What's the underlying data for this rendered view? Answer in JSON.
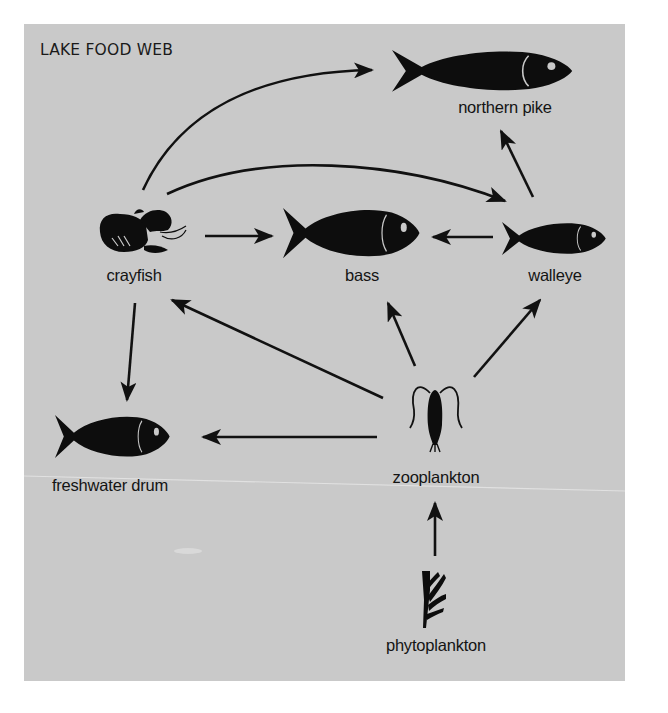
{
  "title": "LAKE FOOD WEB",
  "colors": {
    "background": "#c9c9c9",
    "ink": "#111111",
    "page": "#ffffff"
  },
  "nodes": [
    {
      "id": "northern-pike",
      "label": "northern pike",
      "icon": "fish-icon",
      "label_x": 505,
      "label_y": 98
    },
    {
      "id": "crayfish",
      "label": "crayfish",
      "icon": "crayfish-icon",
      "label_x": 134,
      "label_y": 266
    },
    {
      "id": "bass",
      "label": "bass",
      "icon": "fish-icon",
      "label_x": 362,
      "label_y": 266
    },
    {
      "id": "walleye",
      "label": "walleye",
      "icon": "fish-icon",
      "label_x": 555,
      "label_y": 266
    },
    {
      "id": "freshwater-drum",
      "label": "freshwater drum",
      "icon": "fish-icon",
      "label_x": 110,
      "label_y": 476
    },
    {
      "id": "zooplankton",
      "label": "zooplankton",
      "icon": "copepod-icon",
      "label_x": 436,
      "label_y": 468
    },
    {
      "id": "phytoplankton",
      "label": "phytoplankton",
      "icon": "algae-icon",
      "label_x": 436,
      "label_y": 636
    }
  ],
  "edges": [
    {
      "from": "crayfish",
      "to": "northern-pike"
    },
    {
      "from": "crayfish",
      "to": "walleye"
    },
    {
      "from": "walleye",
      "to": "northern-pike"
    },
    {
      "from": "crayfish",
      "to": "bass"
    },
    {
      "from": "walleye",
      "to": "bass"
    },
    {
      "from": "crayfish",
      "to": "freshwater-drum"
    },
    {
      "from": "zooplankton",
      "to": "crayfish"
    },
    {
      "from": "zooplankton",
      "to": "bass"
    },
    {
      "from": "zooplankton",
      "to": "walleye"
    },
    {
      "from": "zooplankton",
      "to": "freshwater-drum"
    },
    {
      "from": "phytoplankton",
      "to": "zooplankton"
    }
  ]
}
